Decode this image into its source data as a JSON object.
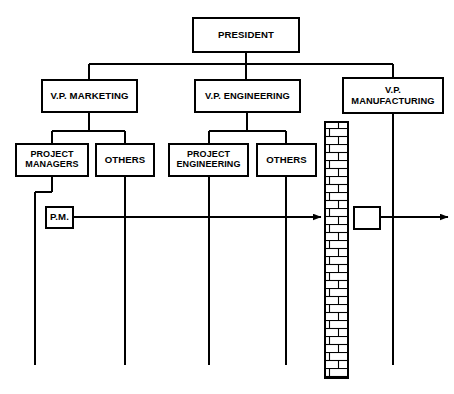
{
  "diagram": {
    "type": "org-chart",
    "width": 454,
    "height": 394,
    "line_color": "#000000",
    "background_color": "#ffffff"
  },
  "nodes": {
    "president": {
      "label": "PRESIDENT",
      "x": 192,
      "y": 17,
      "w": 108,
      "h": 36
    },
    "vp_marketing": {
      "label": "V.P. MARKETING",
      "x": 41,
      "y": 79,
      "w": 97,
      "h": 34
    },
    "vp_engineering": {
      "label": "V.P. ENGINEERING",
      "x": 194,
      "y": 79,
      "w": 107,
      "h": 34
    },
    "vp_manufacturing": {
      "label": "V.P.\nMANUFACTURING",
      "x": 342,
      "y": 77,
      "w": 102,
      "h": 37
    },
    "project_managers": {
      "label": "PROJECT\nMANAGERS",
      "x": 15,
      "y": 143,
      "w": 74,
      "h": 34
    },
    "others_marketing": {
      "label": "OTHERS",
      "x": 95,
      "y": 143,
      "w": 60,
      "h": 34
    },
    "project_engineering": {
      "label": "PROJECT\nENGINEERING",
      "x": 168,
      "y": 143,
      "w": 81,
      "h": 34
    },
    "others_engineering": {
      "label": "OTHERS",
      "x": 256,
      "y": 143,
      "w": 61,
      "h": 34
    },
    "project_manager_pm": {
      "label": "P.M.",
      "x": 45,
      "y": 206,
      "w": 29,
      "h": 23
    },
    "manufacturing_target": {
      "label": "",
      "x": 353,
      "y": 206,
      "w": 28,
      "h": 24
    }
  },
  "wall": {
    "name": "brick-wall",
    "x": 325,
    "y": 122,
    "w": 23,
    "h": 256,
    "brick_rows": 32,
    "color": "#000000"
  },
  "connectors": {
    "president_stem_x": 246,
    "bus_y": 64,
    "bus_left_x": 89,
    "bus_right_x": 393,
    "marketing_sub_bus_y": 131,
    "marketing_sub_left_x": 52,
    "marketing_sub_right_x": 125,
    "engineering_sub_bus_y": 131,
    "engineering_sub_left_x": 209,
    "engineering_sub_right_x": 286,
    "vertical_lines_x": [
      35,
      125,
      209,
      286,
      393
    ],
    "vertical_lines_bottom_y": 365,
    "pm_flow_y": 217,
    "pm_flow_start_x": 74,
    "pm_flow_arrow_x": 321,
    "out_flow_start_x": 381,
    "out_flow_arrow_x": 448
  }
}
